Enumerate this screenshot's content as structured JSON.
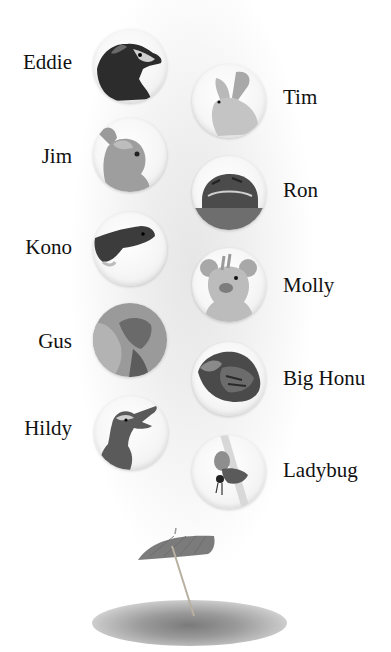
{
  "characters": [
    {
      "name": "Eddie",
      "animal": "raccoon",
      "column": "left"
    },
    {
      "name": "Tim",
      "animal": "rabbit",
      "column": "right"
    },
    {
      "name": "Jim",
      "animal": "bird",
      "column": "left"
    },
    {
      "name": "Ron",
      "animal": "frog",
      "column": "right"
    },
    {
      "name": "Kono",
      "animal": "gecko",
      "column": "left"
    },
    {
      "name": "Molly",
      "animal": "mouse",
      "column": "right"
    },
    {
      "name": "Gus",
      "animal": "lizard",
      "column": "left"
    },
    {
      "name": "Big Honu",
      "animal": "sea turtle",
      "column": "right"
    },
    {
      "name": "Hildy",
      "animal": "duck",
      "column": "left"
    },
    {
      "name": "Ladybug",
      "animal": "ladybug",
      "column": "right"
    }
  ],
  "decoration": {
    "icon": "cocktail-umbrella-icon"
  }
}
